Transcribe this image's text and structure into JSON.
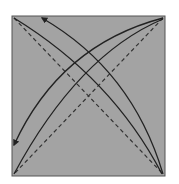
{
  "diagram": {
    "type": "origami-fold-diagram",
    "paper": {
      "x": 12,
      "y": 16,
      "width": 153,
      "height": 160,
      "fill": "#a3a3a3",
      "stroke": "#555555"
    },
    "creases": [
      {
        "name": "diagonal-tl-br",
        "style": "dashed",
        "from": [
          14,
          18
        ],
        "to": [
          163,
          174
        ]
      },
      {
        "name": "diagonal-tr-bl",
        "style": "dashed",
        "from": [
          163,
          18
        ],
        "to": [
          14,
          174
        ]
      }
    ],
    "arrows": [
      {
        "name": "arrow-br-to-tl-outer",
        "from": [
          163,
          174
        ],
        "to": [
          42,
          18
        ]
      },
      {
        "name": "arrow-br-to-tl-inner",
        "from": [
          161,
          172
        ],
        "to": [
          14,
          18
        ]
      },
      {
        "name": "arrow-tr-to-bl-outer",
        "from": [
          163,
          18
        ],
        "to": [
          14,
          145
        ]
      },
      {
        "name": "arrow-tr-to-bl-inner",
        "from": [
          161,
          20
        ],
        "to": [
          14,
          174
        ]
      }
    ],
    "colors": {
      "line": "#222222",
      "paper": "#a3a3a3",
      "background": "#ffffff"
    }
  }
}
